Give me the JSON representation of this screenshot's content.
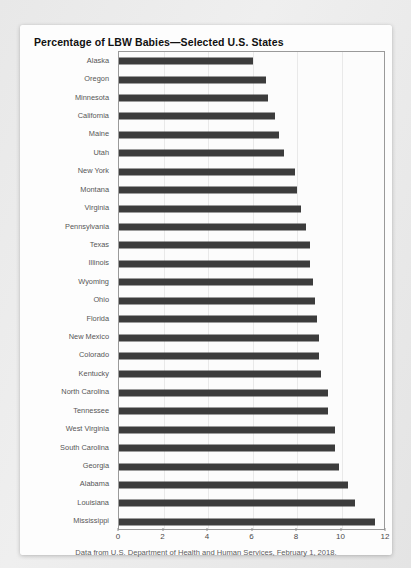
{
  "card": {
    "title": "Percentage of LBW Babies—Selected U.S. States",
    "caption": "Data from U.S. Department of Health and Human Services, February 1, 2018."
  },
  "colors": {
    "bar": "#3c3c3c",
    "frame": "#9a9a9a",
    "grid": "#e9e9e9",
    "label": "#565656",
    "card_bg": "#fdfdfd",
    "page_bg": "#ebebeb"
  },
  "chart_data": {
    "type": "bar",
    "orientation": "horizontal",
    "title": "Percentage of LBW Babies—Selected U.S. States",
    "xlabel": "",
    "ylabel": "",
    "xlim": [
      0,
      12
    ],
    "xticks": [
      0,
      2,
      4,
      6,
      8,
      10,
      12
    ],
    "xtick_labels": [
      "0",
      "2",
      "4",
      "6",
      "8",
      "10",
      "12"
    ],
    "grid": true,
    "grid_axis": "x",
    "legend": false,
    "categories": [
      "Alaska",
      "Oregon",
      "Minnesota",
      "California",
      "Maine",
      "Utah",
      "New York",
      "Montana",
      "Virginia",
      "Pennsylvania",
      "Texas",
      "Illinois",
      "Wyoming",
      "Ohio",
      "Florida",
      "New Mexico",
      "Colorado",
      "Kentucky",
      "North Carolina",
      "Tennessee",
      "West Virginia",
      "South Carolina",
      "Georgia",
      "Alabama",
      "Louisiana",
      "Mississippi"
    ],
    "values": [
      6.0,
      6.6,
      6.7,
      7.0,
      7.2,
      7.4,
      7.9,
      8.0,
      8.2,
      8.4,
      8.6,
      8.6,
      8.7,
      8.8,
      8.9,
      9.0,
      9.0,
      9.1,
      9.4,
      9.4,
      9.7,
      9.7,
      9.9,
      10.3,
      10.6,
      11.5
    ],
    "source_note": "Data from U.S. Department of Health and Human Services, February 1, 2018."
  }
}
